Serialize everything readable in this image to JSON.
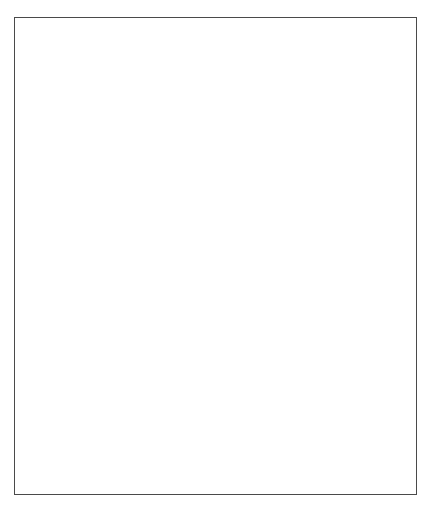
{
  "figure": {
    "caption": "FIGURE 11.3   The generations:",
    "border_color": "#4a4a4a"
  },
  "chart_data": [
    {
      "id": "unemployment",
      "type": "line",
      "title": "",
      "xlabel": "Year",
      "ylabel": "Unemployment Rate (%)",
      "categories": [
        "1965",
        "1975",
        "1985",
        "1992",
        "1996"
      ],
      "x_ticks": [
        "1965",
        "1975",
        "1985",
        "1992",
        "1996"
      ],
      "y_ticks": [
        "0",
        "3",
        "6",
        "9",
        "12"
      ],
      "ylim": [
        0,
        12
      ],
      "grid": false,
      "legend_position": "inline",
      "series": [
        {
          "name": "Unemployment Rate",
          "values": [
            0.2,
            3.6,
            8.0,
            7.6,
            11.0
          ],
          "color": "#1a1a1a",
          "label_x": "1972",
          "label_y": 9.4
        }
      ]
    },
    {
      "id": "tax-share",
      "type": "line",
      "title": "",
      "xlabel": "Year",
      "ylabel": "Tax Share (%)",
      "categories": [
        "1965",
        "1975",
        "1985",
        "1992",
        "1996"
      ],
      "x_ticks": [
        "1965",
        "1975",
        "1985",
        "1992",
        "1996"
      ],
      "y_ticks": [
        "0",
        "10",
        "20",
        "30",
        "40"
      ],
      "ylim": [
        0,
        40
      ],
      "grid": false,
      "legend_position": "inline",
      "series": [
        {
          "name": "Social Security Tax Share",
          "values": [
            27.0,
            34.0,
            34.8,
            39.0,
            38.8
          ],
          "color": "#1a1a1a",
          "label_x": "1983",
          "label_y": 29.5
        },
        {
          "name": "Corporation Tax Share",
          "values": [
            8.0,
            4.0,
            4.8,
            3.8,
            3.6
          ],
          "color": "#1a1a1a",
          "label_x": "1983",
          "label_y": 10.6
        }
      ]
    }
  ]
}
